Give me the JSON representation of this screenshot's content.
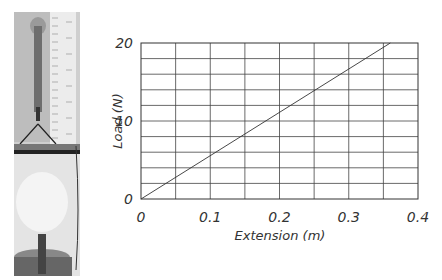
{
  "photo": {
    "description": "spring balance with ruler and hanging mass pan"
  },
  "chart_data": {
    "type": "line",
    "title": "",
    "xlabel": "Extension (m)",
    "ylabel": "Load (N)",
    "xlim": [
      0,
      0.4
    ],
    "ylim": [
      0,
      20
    ],
    "x_ticks": [
      "0",
      "0.1",
      "0.2",
      "0.3",
      "0.4"
    ],
    "y_ticks": [
      "0",
      "10",
      "20"
    ],
    "grid": true,
    "grid_x_step": 0.05,
    "grid_y_step": 2,
    "series": [
      {
        "name": "Load vs Extension",
        "x": [
          0,
          0.36
        ],
        "y": [
          0,
          20
        ]
      }
    ],
    "legend": null
  }
}
